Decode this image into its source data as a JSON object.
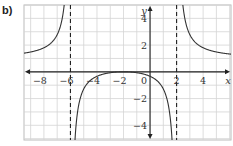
{
  "figure_label": "b)",
  "chart_data": {
    "type": "line",
    "title": "",
    "xlabel": "x",
    "ylabel": "y",
    "xlim": [
      -9.5,
      6.1
    ],
    "ylim": [
      -5.1,
      5.0
    ],
    "grid": true,
    "x_ticks": [
      -8,
      -6,
      -4,
      -2,
      0,
      2,
      4
    ],
    "x_tick_labels": [
      "−8",
      "−6",
      "−4",
      "−2",
      "0",
      "2",
      "4"
    ],
    "y_ticks": [
      4,
      2,
      -2,
      -4
    ],
    "y_tick_labels": [
      "4",
      "2",
      "−2",
      "−4"
    ],
    "vertical_asymptotes": [
      -6,
      2
    ],
    "horizontal_asymptote": 1,
    "function": "y = (x+2)^2 / ((x+6)(x-2))",
    "series": [
      {
        "name": "left branch",
        "x": [
          -9.5,
          -9,
          -8,
          -7.5,
          -7,
          -6.6,
          -6.3
        ],
        "y": [
          1.4,
          1.53,
          2.0,
          2.59,
          3.89,
          6.67,
          13.3
        ]
      },
      {
        "name": "middle branch",
        "x": [
          -5.7,
          -5.5,
          -5,
          -4,
          -3,
          -2,
          -1,
          0,
          1,
          1.5
        ],
        "y": [
          -14.3,
          -6.3,
          -3.0,
          -0.67,
          -0.07,
          0,
          -0.07,
          -0.33,
          -1.29,
          -4.41
        ]
      },
      {
        "name": "right branch",
        "x": [
          2.4,
          2.6,
          3,
          4,
          5,
          6
        ],
        "y": [
          13.5,
          8.2,
          4.44,
          1.8,
          1.49,
          1.33
        ]
      }
    ]
  }
}
